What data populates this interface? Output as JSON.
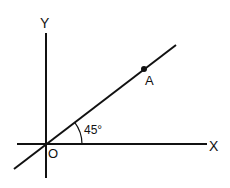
{
  "diagram": {
    "axes": {
      "x_label": "X",
      "y_label": "Y",
      "origin_label": "O"
    },
    "line": {
      "point_label": "A",
      "angle_label": "45°",
      "angle_degrees": 45
    },
    "colors": {
      "stroke": "#111111",
      "background": "#ffffff"
    }
  }
}
